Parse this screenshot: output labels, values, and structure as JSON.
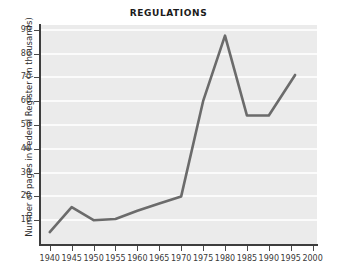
{
  "chart_data": {
    "type": "line",
    "title": "REGULATIONS",
    "xlabel": "",
    "ylabel": "Number of pages in Federal Register (in thousands)",
    "x": [
      1940,
      1945,
      1950,
      1955,
      1960,
      1965,
      1970,
      1975,
      1980,
      1985,
      1990,
      1996
    ],
    "values": [
      5,
      15.5,
      10,
      10.5,
      14,
      17,
      20,
      60,
      87.5,
      54,
      54,
      71
    ],
    "series": [
      {
        "name": "Number of pages in Federal Register (in thousands)",
        "values": [
          5,
          15.5,
          10,
          10.5,
          14,
          17,
          20,
          60,
          87.5,
          54,
          54,
          71
        ]
      }
    ],
    "xlim": [
      1938,
      2001
    ],
    "ylim": [
      0,
      92
    ],
    "xticks": [
      1940,
      1945,
      1950,
      1955,
      1960,
      1965,
      1970,
      1975,
      1980,
      1985,
      1990,
      1995,
      2000
    ],
    "xtick_labels": [
      "1940",
      "1945",
      "1950",
      "1955",
      "1960",
      "1965",
      "1970",
      "1975",
      "1980",
      "1985",
      "1990",
      "1995",
      "2000"
    ],
    "yticks": [
      10,
      20,
      30,
      40,
      50,
      60,
      70,
      80,
      90
    ],
    "ytick_labels": [
      "10",
      "20",
      "30",
      "40",
      "50",
      "60",
      "70",
      "80",
      "90"
    ],
    "grid": "horizontal",
    "legend": "none",
    "line_color": "#6b6b6b",
    "plot_background": "#ebebeb",
    "gridline_color": "#fbfbfb",
    "axis_color": "#3d3d3d",
    "figure_background": "#ffffff"
  }
}
